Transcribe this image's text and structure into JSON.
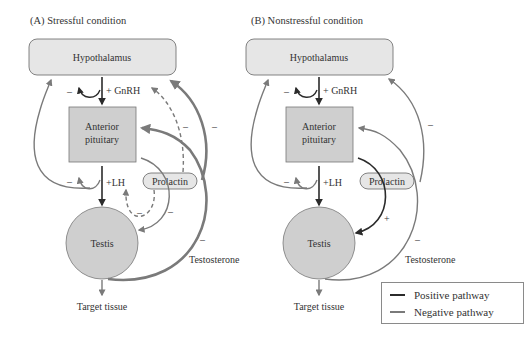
{
  "panels": [
    {
      "id": "A",
      "title": "(A)  Stressful condition",
      "hypothalamus": "Hypothalamus",
      "pituitary_line1": "Anterior",
      "pituitary_line2": "pituitary",
      "testis": "Testis",
      "prolactin": "Prolactin",
      "gnrh": "+ GnRH",
      "lh": "+LH",
      "testosterone": "Testosterone",
      "target": "Target tissue",
      "minus": "–",
      "plus": "+"
    },
    {
      "id": "B",
      "title": "(B)  Nonstressful condition",
      "hypothalamus": "Hypothalamus",
      "pituitary_line1": "Anterior",
      "pituitary_line2": "pituitary",
      "testis": "Testis",
      "prolactin": "Prolactin",
      "gnrh": "+ GnRH",
      "lh": "+LH",
      "testosterone": "Testosterone",
      "target": "Target tissue",
      "minus": "–",
      "plus": "+"
    }
  ],
  "legend": {
    "positive_label": "Positive pathway",
    "negative_label": "Negative pathway",
    "positive_color": "#2b2b2b",
    "negative_color": "#7a7a7a"
  },
  "colors": {
    "box_fill": "#e6e6e6",
    "pituitary_fill": "#cfcfcf",
    "testis_fill": "#cfcfcf",
    "negative": "#7a7a7a",
    "positive": "#2b2b2b"
  }
}
